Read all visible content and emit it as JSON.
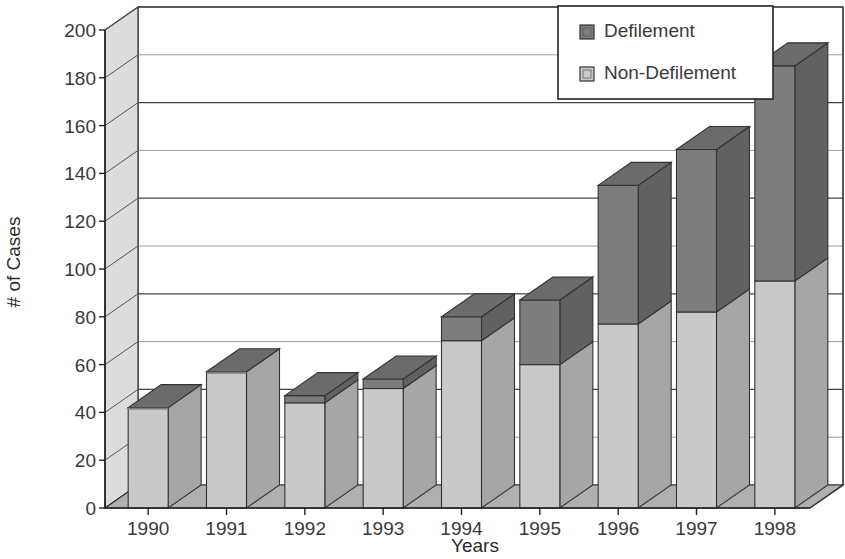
{
  "chart_data": {
    "type": "bar",
    "subtype": "stacked-3d-column",
    "title": "",
    "xlabel": "Years",
    "ylabel": "# of Cases",
    "categories": [
      "1990",
      "1991",
      "1992",
      "1993",
      "1994",
      "1995",
      "1996",
      "1997",
      "1998"
    ],
    "series": [
      {
        "name": "Non-Defilement",
        "color": "#c9c9c9",
        "values": [
          42,
          57,
          44,
          50,
          70,
          60,
          77,
          82,
          95
        ]
      },
      {
        "name": "Defilement",
        "color": "#7d7d7d",
        "values": [
          0,
          0,
          3,
          4,
          10,
          27,
          58,
          68,
          90
        ]
      }
    ],
    "totals": [
      42,
      57,
      47,
      54,
      80,
      87,
      135,
      150,
      185
    ],
    "ylim": [
      0,
      200
    ],
    "yticks": [
      0,
      20,
      40,
      60,
      80,
      100,
      120,
      140,
      160,
      180,
      200
    ],
    "ytick_labels": [
      "0",
      "20",
      "40",
      "60",
      "80",
      "100",
      "120",
      "140",
      "160",
      "180",
      "200"
    ],
    "grid": true,
    "legend_position": "top-right",
    "legend_entries": [
      "Defilement",
      "Non-Defilement"
    ]
  },
  "legend": {
    "items": [
      {
        "label": "Defilement",
        "swatch": "#7d7d7d"
      },
      {
        "label": "Non-Defilement",
        "swatch": "#c9c9c9"
      }
    ]
  },
  "axes": {
    "y_title": "# of Cases",
    "x_title": "Years"
  },
  "colors": {
    "bar_front_light": "#c9c9c9",
    "bar_front_dark": "#7d7d7d",
    "bar_side_light": "#a6a6a6",
    "bar_side_dark": "#616161",
    "bar_top_dark": "#6b6b6b",
    "bar_top_light": "#b5b5b5",
    "wall_back": "#ffffff",
    "wall_left": "#dcdcdc",
    "floor": "#9a9a9a",
    "floor_top": "#b0b0b0",
    "outline": "#333333",
    "gridline": "#6e6e6e",
    "text": "#3a3a3a"
  }
}
